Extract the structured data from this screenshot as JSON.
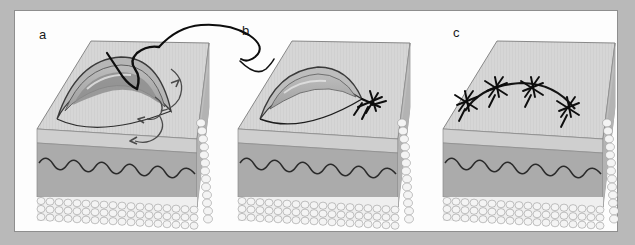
{
  "figure": {
    "domain_description": "Three-panel medical illustration of a surgical skin-flap suturing sequence drawn on 3-D blocks of skin",
    "background_color": "#b9b9b9",
    "frame_fill": "#fdfdfd",
    "frame_border_color": "#8e8e8e",
    "panels": [
      {
        "id": "a",
        "label": "a",
        "caption_text": "",
        "stage": "needle-and-thread passing through crescent flap edge with directional arrows",
        "features": [
          "crescent-shaped skin flap with layered gray bands",
          "curved suture needle entering flap apex",
          "long black thread trailing up and to the right",
          "three curved guide arrows indicating thread direction"
        ]
      },
      {
        "id": "b",
        "label": "b",
        "caption_text": "",
        "stage": "first suture tied at the right flap corner",
        "features": [
          "crescent flap now flattened and approximated",
          "single star-shaped knot at right corner",
          "thread tail arriving from panel a"
        ]
      },
      {
        "id": "c",
        "label": "c",
        "caption_text": "",
        "stage": "wound fully closed with four interrupted sutures",
        "features": [
          "curved closure line across top surface",
          "four star-shaped knots evenly spaced along the line"
        ]
      }
    ],
    "skin_layers": [
      {
        "name": "epidermis-top-surface",
        "color": "#d5d5d5"
      },
      {
        "name": "epidermis-front-face",
        "color": "#cfcfcf"
      },
      {
        "name": "dermis-band",
        "color": "#a3a3a3"
      },
      {
        "name": "dermis-lower",
        "color": "#b0b0b0"
      },
      {
        "name": "subcutaneous-fat-cells",
        "color": "#f2f2f2"
      }
    ],
    "line_colors": {
      "suture_thread": "#111111",
      "dermal_wave": "#2b2b2b",
      "block_outline": "#6f6f6f",
      "flap_outline": "#3a3a3a"
    }
  }
}
